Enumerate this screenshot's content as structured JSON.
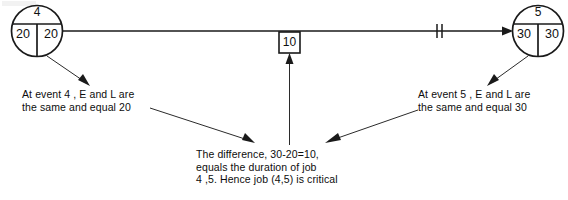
{
  "diagram": {
    "type": "cpm-network-event-diagram",
    "nodes": [
      {
        "id": "event-4",
        "event_number": "4",
        "earliest_time": "20",
        "latest_time": "20"
      },
      {
        "id": "event-5",
        "event_number": "5",
        "earliest_time": "30",
        "latest_time": "30"
      }
    ],
    "activity": {
      "duration_label": "10",
      "tick_marks": 2,
      "from": "4",
      "to": "5"
    },
    "captions": {
      "left": {
        "line1": "At event  4 , E and L are",
        "line2": "the same and equal  20"
      },
      "right": {
        "line1": "At event   5 , E and L are",
        "line2": "the same and equal   30"
      },
      "center": {
        "line1": "The difference, 30-20=10,",
        "line2": "equals the duration of job",
        "line3": "4 ,5. Hence job (4,5) is critical"
      }
    },
    "colors": {
      "ink": "#1a1a1a",
      "background": "#ffffff"
    }
  }
}
